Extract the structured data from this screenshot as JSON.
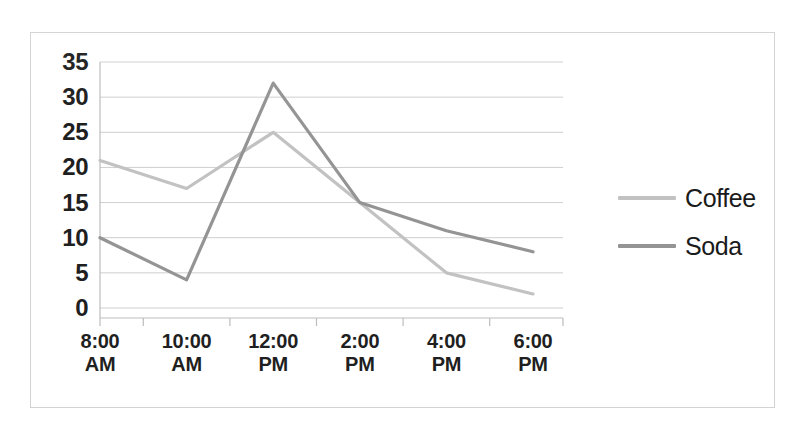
{
  "chart_data": {
    "type": "line",
    "title": "",
    "subtitle": "",
    "xlabel": "",
    "ylabel": "",
    "categories": [
      "8:00 AM",
      "10:00 AM",
      "12:00 PM",
      "2:00 PM",
      "4:00 PM",
      "6:00 PM"
    ],
    "category_lines": [
      {
        "time": "8:00",
        "meridiem": "AM"
      },
      {
        "time": "10:00",
        "meridiem": "AM"
      },
      {
        "time": "12:00",
        "meridiem": "PM"
      },
      {
        "time": "2:00",
        "meridiem": "PM"
      },
      {
        "time": "4:00",
        "meridiem": "PM"
      },
      {
        "time": "6:00",
        "meridiem": "PM"
      }
    ],
    "series": [
      {
        "name": "Coffee",
        "color": "#c2c2c2",
        "values": [
          21,
          17,
          25,
          15,
          5,
          2
        ]
      },
      {
        "name": "Soda",
        "color": "#949494",
        "values": [
          10,
          4,
          32,
          15,
          11,
          8
        ]
      }
    ],
    "ylim": [
      0,
      35
    ],
    "ytick_step": 5,
    "ytick_labels": [
      "35",
      "30",
      "25",
      "20",
      "15",
      "10",
      "5",
      "0"
    ],
    "ytick_values": [
      35,
      30,
      25,
      20,
      15,
      10,
      5,
      0
    ],
    "grid": true,
    "grid_axis": "y",
    "grid_color": "#cfcfcf",
    "axis_color": "#bdbdbd",
    "legend": {
      "position": "right",
      "entries": [
        {
          "label": "Coffee",
          "color": "#c2c2c2"
        },
        {
          "label": "Soda",
          "color": "#949494"
        }
      ]
    },
    "plot_background": "#ffffff",
    "frame_color": "#d3d3d3"
  },
  "legend": {
    "entries": [
      {
        "label": "Coffee"
      },
      {
        "label": "Soda"
      }
    ]
  }
}
